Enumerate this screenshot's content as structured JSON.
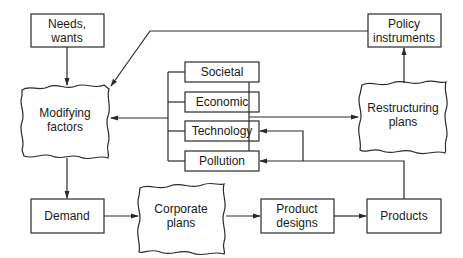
{
  "diagram": {
    "nodes": {
      "needs": {
        "lines": [
          "Needs,",
          "wants"
        ],
        "shape": "rectangle"
      },
      "policy": {
        "lines": [
          "Policy",
          "instruments"
        ],
        "shape": "rectangle"
      },
      "modifying": {
        "lines": [
          "Modifying",
          "factors"
        ],
        "shape": "wavy"
      },
      "restructuring": {
        "lines": [
          "Restructuring",
          "plans"
        ],
        "shape": "wavy"
      },
      "societal": {
        "lines": [
          "Societal"
        ],
        "shape": "rectangle"
      },
      "economic": {
        "lines": [
          "Economic"
        ],
        "shape": "rectangle"
      },
      "technology": {
        "lines": [
          "Technology"
        ],
        "shape": "rectangle"
      },
      "pollution": {
        "lines": [
          "Pollution"
        ],
        "shape": "rectangle"
      },
      "demand": {
        "lines": [
          "Demand"
        ],
        "shape": "rectangle"
      },
      "corporate": {
        "lines": [
          "Corporate",
          "plans"
        ],
        "shape": "wavy"
      },
      "designs": {
        "lines": [
          "Product",
          "designs"
        ],
        "shape": "rectangle"
      },
      "products": {
        "lines": [
          "Products"
        ],
        "shape": "rectangle"
      }
    },
    "edges": [
      {
        "from": "Needs, wants",
        "to": "Modifying factors"
      },
      {
        "from": "Policy instruments",
        "to": "Modifying factors"
      },
      {
        "from": "Factor group (Societal/Economic/Technology/Pollution)",
        "to": "Modifying factors"
      },
      {
        "from": "Factor group",
        "to": "Restructuring plans"
      },
      {
        "from": "Restructuring plans",
        "to": "Policy instruments"
      },
      {
        "from": "Modifying factors",
        "to": "Demand"
      },
      {
        "from": "Demand",
        "to": "Corporate plans"
      },
      {
        "from": "Corporate plans",
        "to": "Product designs"
      },
      {
        "from": "Product designs",
        "to": "Products"
      },
      {
        "from": "Products",
        "to": "Technology"
      },
      {
        "from": "Products",
        "to": "Pollution"
      }
    ],
    "colors": {
      "stroke": "#2a2a2a",
      "text": "#1a1a1a",
      "background": "#ffffff"
    }
  }
}
